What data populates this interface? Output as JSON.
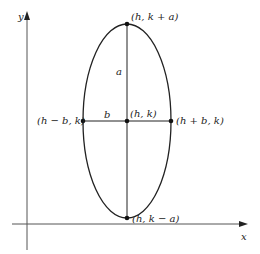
{
  "diagram": {
    "type": "ellipse-vertical-major-axis",
    "axes": {
      "x_label": "x",
      "y_label": "y"
    },
    "points": {
      "top": "(h, k + a)",
      "bottom": "(h, k − a)",
      "center": "(h, k)",
      "left": "(h − b, k)",
      "right": "(h + b, k)"
    },
    "segment_labels": {
      "semi_major": "a",
      "semi_minor": "b"
    },
    "colors": {
      "stroke": "#222222",
      "axis": "#555555",
      "background": "#ffffff"
    }
  }
}
